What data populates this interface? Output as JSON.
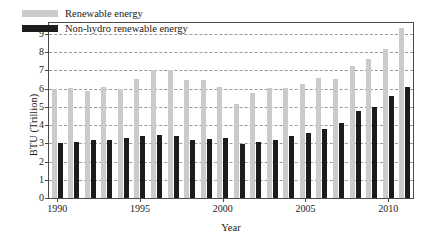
{
  "chart_data": {
    "type": "bar",
    "title": "",
    "subtitle": "",
    "xlabel": "Year",
    "ylabel": "BTU (Trillion)",
    "ylim": [
      0,
      9.6
    ],
    "ytick_values": [
      0,
      1,
      2,
      3,
      4,
      5,
      6,
      7,
      8,
      9
    ],
    "ytick_labels": [
      "0",
      "1",
      "2",
      "3",
      "4",
      "5",
      "6",
      "7",
      "8",
      "9"
    ],
    "grid": true,
    "grid_axis": "y",
    "grid_style": "dashed",
    "legend_position": "upper left",
    "xtick_values": [
      1990,
      1995,
      2000,
      2005,
      2010
    ],
    "xtick_labels": [
      "1990",
      "1995",
      "2000",
      "2005",
      "2010"
    ],
    "categories": [
      1990,
      1991,
      1992,
      1993,
      1994,
      1995,
      1996,
      1997,
      1998,
      1999,
      2000,
      2001,
      2002,
      2003,
      2004,
      2005,
      2006,
      2007,
      2008,
      2009,
      2010,
      2011
    ],
    "series": [
      {
        "name": "Renewable energy",
        "color": "#cbcbcb",
        "values": [
          6.0,
          6.05,
          5.85,
          6.1,
          6.0,
          6.55,
          7.0,
          7.0,
          6.5,
          6.5,
          6.1,
          5.15,
          5.75,
          6.05,
          6.05,
          6.25,
          6.6,
          6.55,
          7.25,
          7.65,
          8.2,
          9.3
        ]
      },
      {
        "name": "Non-hydro renewable energy",
        "color": "#1c1c1c",
        "values": [
          3.0,
          3.05,
          3.2,
          3.2,
          3.3,
          3.4,
          3.45,
          3.4,
          3.2,
          3.25,
          3.3,
          2.95,
          3.08,
          3.18,
          3.42,
          3.58,
          3.8,
          4.12,
          4.75,
          5.02,
          5.62,
          6.1
        ]
      }
    ]
  },
  "legend": {
    "items": [
      {
        "label": "Renewable energy",
        "swatch": "light"
      },
      {
        "label": "Non-hydro renewable energy",
        "swatch": "dark"
      }
    ]
  }
}
